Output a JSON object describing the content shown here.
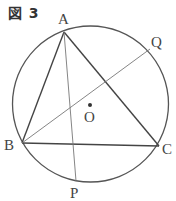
{
  "figure": {
    "title": "図 3",
    "circle": {
      "cx": 90.5,
      "cy": 104,
      "r": 78,
      "center_label": "O"
    },
    "points": {
      "A": {
        "x": 64,
        "y": 32,
        "label": "A",
        "lx": 58,
        "ly": 22
      },
      "B": {
        "x": 22,
        "y": 143,
        "label": "B",
        "lx": 5,
        "ly": 150
      },
      "C": {
        "x": 159,
        "y": 146,
        "label": "C",
        "lx": 163,
        "ly": 154
      },
      "P": {
        "x": 76,
        "y": 181,
        "label": "P",
        "lx": 70,
        "ly": 197
      },
      "Q": {
        "x": 150,
        "y": 49,
        "label": "Q",
        "lx": 152,
        "ly": 46
      },
      "O": {
        "x": 90,
        "y": 105,
        "label": "O",
        "lx": 85,
        "ly": 121
      }
    },
    "segments": [
      {
        "from": "A",
        "to": "B",
        "weight": "bold"
      },
      {
        "from": "A",
        "to": "C",
        "weight": "bold"
      },
      {
        "from": "B",
        "to": "C",
        "weight": "bold"
      },
      {
        "from": "A",
        "to": "P",
        "weight": "thin"
      },
      {
        "from": "B",
        "to": "Q",
        "weight": "thin"
      }
    ],
    "colors": {
      "line": "#444444",
      "thin": "#777777",
      "text": "#444444"
    }
  }
}
